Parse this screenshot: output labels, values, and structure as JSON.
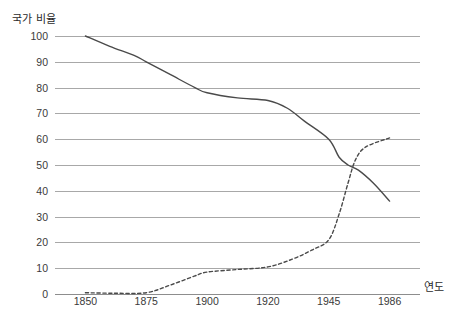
{
  "chart_data": {
    "type": "line",
    "title": "",
    "subtitle": "",
    "xlabel": "연도",
    "ylabel": "국가 비율",
    "categories": [
      "1850",
      "1875",
      "1900",
      "1920",
      "1945",
      "1986"
    ],
    "x_tick_labels": [
      "1850",
      "1875",
      "1900",
      "1920",
      "1945",
      "1986"
    ],
    "y_tick_labels": [
      "100",
      "90",
      "80",
      "70",
      "60",
      "50",
      "40",
      "30",
      "20",
      "10",
      "0"
    ],
    "ylim": [
      0,
      100
    ],
    "y_tick_step": 10,
    "grid": "horizontal",
    "legend": "none",
    "axis_note": "x axis is categorical: tick labels evenly spaced",
    "line_color": "#4a4a4a",
    "grid_color": "#a8a8a8",
    "background_color": "#ffffff",
    "series": [
      {
        "name": "solid-declining-series",
        "style": "solid",
        "values_at_ticks": [
          100,
          90,
          78,
          75,
          60,
          36
        ],
        "points": [
          {
            "x": "1850",
            "y": 100
          },
          {
            "x": "1860",
            "y": 96
          },
          {
            "x": "1870",
            "y": 92.5
          },
          {
            "x": "1875",
            "y": 90
          },
          {
            "x": "1885",
            "y": 85
          },
          {
            "x": "1895",
            "y": 80
          },
          {
            "x": "1900",
            "y": 78
          },
          {
            "x": "1910",
            "y": 76
          },
          {
            "x": "1920",
            "y": 75
          },
          {
            "x": "1928",
            "y": 72
          },
          {
            "x": "1935",
            "y": 67
          },
          {
            "x": "1945",
            "y": 60
          },
          {
            "x": "1952",
            "y": 53
          },
          {
            "x": "1958",
            "y": 50
          },
          {
            "x": "1965",
            "y": 48
          },
          {
            "x": "1975",
            "y": 43
          },
          {
            "x": "1986",
            "y": 36
          }
        ],
        "start_value": 100,
        "end_value": 36
      },
      {
        "name": "dashed-rising-series",
        "style": "dashed",
        "values_at_ticks": [
          0.5,
          0.5,
          8.5,
          10.5,
          21,
          60.5
        ],
        "points": [
          {
            "x": "1850",
            "y": 0.5
          },
          {
            "x": "1862",
            "y": 0.3
          },
          {
            "x": "1875",
            "y": 0.5
          },
          {
            "x": "1885",
            "y": 3.5
          },
          {
            "x": "1895",
            "y": 7
          },
          {
            "x": "1900",
            "y": 8.5
          },
          {
            "x": "1910",
            "y": 9.5
          },
          {
            "x": "1920",
            "y": 10.5
          },
          {
            "x": "1930",
            "y": 13.5
          },
          {
            "x": "1938",
            "y": 17
          },
          {
            "x": "1945",
            "y": 21
          },
          {
            "x": "1952",
            "y": 31
          },
          {
            "x": "1958",
            "y": 43
          },
          {
            "x": "1963",
            "y": 52
          },
          {
            "x": "1970",
            "y": 57
          },
          {
            "x": "1986",
            "y": 60.5
          }
        ],
        "start_value": 0.5,
        "end_value": 60.5
      }
    ],
    "crossing_point": {
      "approx_y": 48,
      "between_ticks": [
        "1945",
        "1986"
      ]
    }
  }
}
